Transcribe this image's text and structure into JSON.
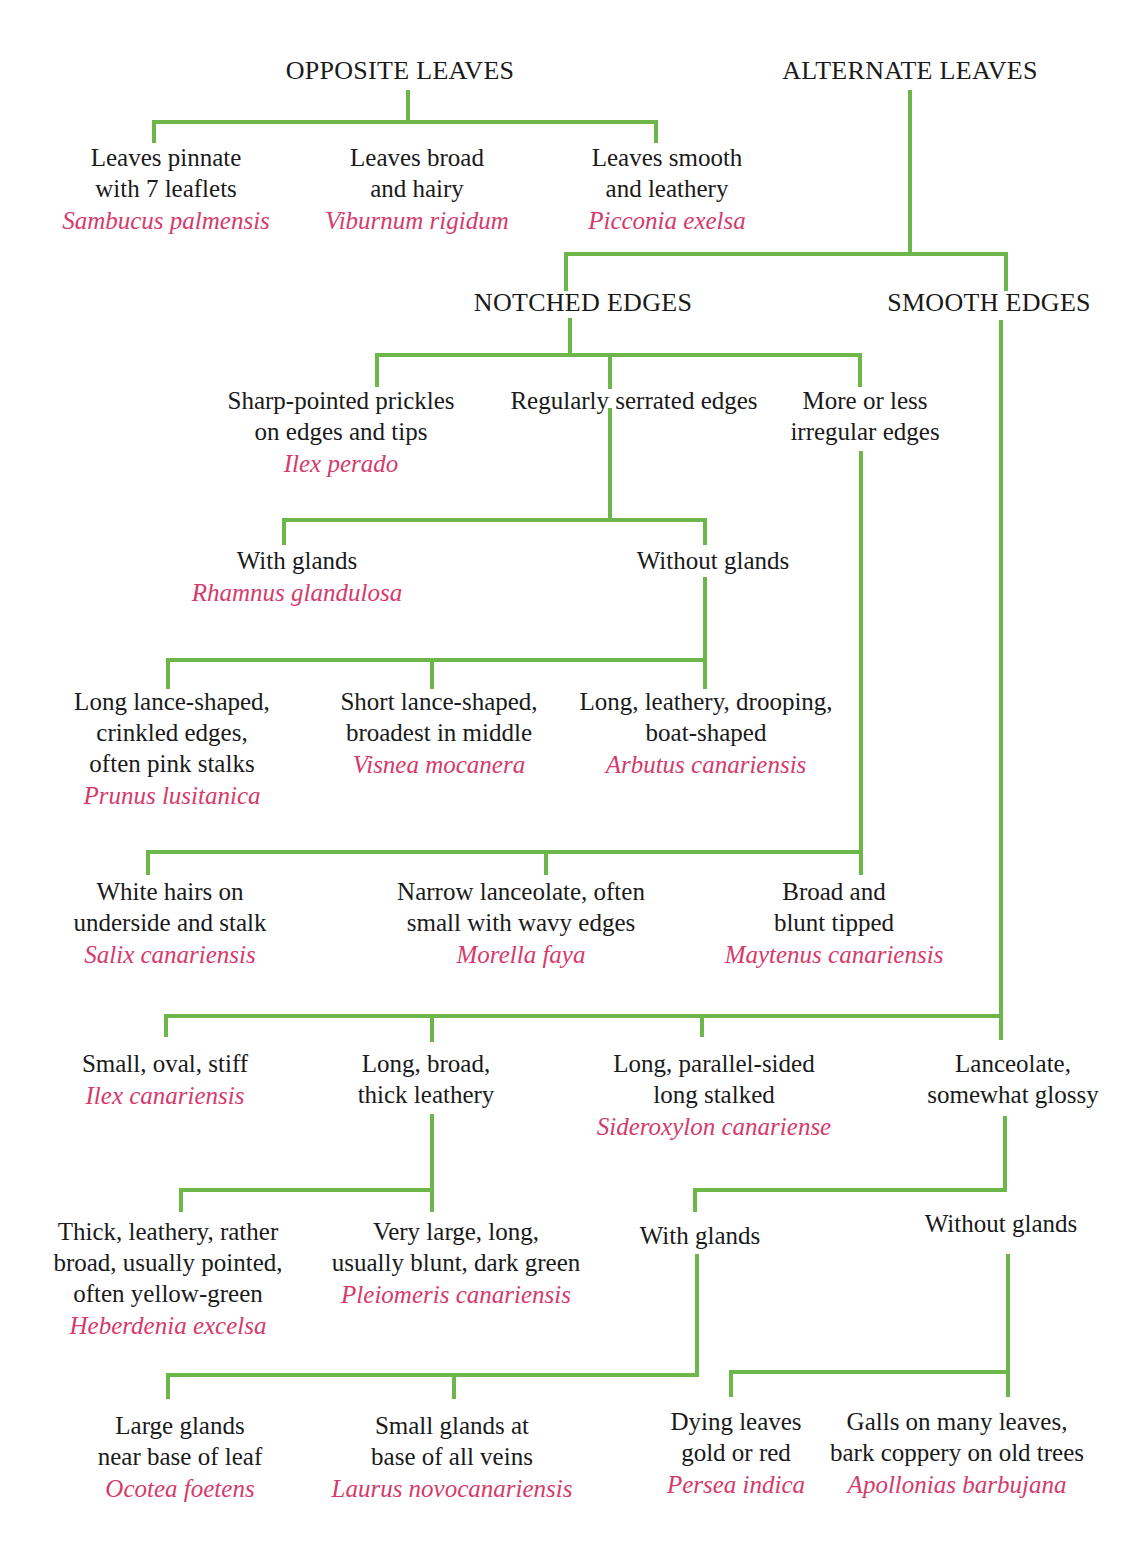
{
  "diagram": {
    "type": "dichotomous-key",
    "colors": {
      "connector": "#6db64a",
      "species": "#d63a6b",
      "text": "#1a1a1a",
      "background": "#ffffff"
    },
    "headings": [
      {
        "id": "opposite",
        "label": "OPPOSITE LEAVES",
        "x": 400,
        "y": 56
      },
      {
        "id": "alternate",
        "label": "ALTERNATE LEAVES",
        "x": 910,
        "y": 56
      },
      {
        "id": "notched",
        "label": "NOTCHED EDGES",
        "x": 583,
        "y": 288
      },
      {
        "id": "smooth",
        "label": "SMOOTH EDGES",
        "x": 989,
        "y": 288
      }
    ],
    "nodes": [
      {
        "id": "n1",
        "parent": "opposite",
        "x": 166,
        "y": 142,
        "lines": [
          "Leaves pinnate",
          "with 7 leaflets"
        ],
        "species": "Sambucus palmensis"
      },
      {
        "id": "n2",
        "parent": "opposite",
        "x": 417,
        "y": 142,
        "lines": [
          "Leaves broad",
          "and hairy"
        ],
        "species": "Viburnum rigidum"
      },
      {
        "id": "n3",
        "parent": "opposite",
        "x": 667,
        "y": 142,
        "lines": [
          "Leaves smooth",
          "and leathery"
        ],
        "species": "Picconia exelsa"
      },
      {
        "id": "n4",
        "parent": "notched",
        "x": 341,
        "y": 385,
        "lines": [
          "Sharp-pointed prickles",
          "on edges and tips"
        ],
        "species": "Ilex perado"
      },
      {
        "id": "n5",
        "parent": "notched",
        "x": 634,
        "y": 385,
        "lines": [
          "Regularly serrated edges"
        ],
        "species": ""
      },
      {
        "id": "n6",
        "parent": "notched",
        "x": 865,
        "y": 385,
        "lines": [
          "More or less",
          "irregular edges"
        ],
        "species": ""
      },
      {
        "id": "n7",
        "parent": "n5",
        "x": 297,
        "y": 545,
        "lines": [
          "With glands"
        ],
        "species": "Rhamnus glandulosa"
      },
      {
        "id": "n8",
        "parent": "n5",
        "x": 713,
        "y": 545,
        "lines": [
          "Without glands"
        ],
        "species": ""
      },
      {
        "id": "n9",
        "parent": "n8",
        "x": 172,
        "y": 686,
        "lines": [
          "Long lance-shaped,",
          "crinkled edges,",
          "often pink stalks"
        ],
        "species": "Prunus lusitanica"
      },
      {
        "id": "n10",
        "parent": "n8",
        "x": 439,
        "y": 686,
        "lines": [
          "Short lance-shaped,",
          "broadest in middle"
        ],
        "species": "Visnea mocanera"
      },
      {
        "id": "n11",
        "parent": "n8",
        "x": 706,
        "y": 686,
        "lines": [
          "Long, leathery, drooping,",
          "boat-shaped"
        ],
        "species": "Arbutus canariensis"
      },
      {
        "id": "n12",
        "parent": "n6",
        "x": 170,
        "y": 876,
        "lines": [
          "White hairs on",
          "underside and stalk"
        ],
        "species": "Salix canariensis"
      },
      {
        "id": "n13",
        "parent": "n6",
        "x": 521,
        "y": 876,
        "lines": [
          "Narrow lanceolate, often",
          "small with wavy edges"
        ],
        "species": "Morella faya"
      },
      {
        "id": "n14",
        "parent": "n6",
        "x": 834,
        "y": 876,
        "lines": [
          "Broad and",
          "blunt tipped"
        ],
        "species": "Maytenus canariensis"
      },
      {
        "id": "n15",
        "parent": "smooth",
        "x": 165,
        "y": 1048,
        "lines": [
          "Small, oval, stiff"
        ],
        "species": "Ilex canariensis"
      },
      {
        "id": "n16",
        "parent": "smooth",
        "x": 426,
        "y": 1048,
        "lines": [
          "Long, broad,",
          "thick leathery"
        ],
        "species": ""
      },
      {
        "id": "n17",
        "parent": "smooth",
        "x": 714,
        "y": 1048,
        "lines": [
          "Long, parallel-sided",
          "long stalked"
        ],
        "species": "Sideroxylon canariense"
      },
      {
        "id": "n18",
        "parent": "smooth",
        "x": 1013,
        "y": 1048,
        "lines": [
          "Lanceolate,",
          "somewhat glossy"
        ],
        "species": ""
      },
      {
        "id": "n19",
        "parent": "n16",
        "x": 168,
        "y": 1216,
        "lines": [
          "Thick, leathery, rather",
          "broad, usually pointed,",
          "often yellow-green"
        ],
        "species": "Heberdenia excelsa"
      },
      {
        "id": "n20",
        "parent": "n16",
        "x": 456,
        "y": 1216,
        "lines": [
          "Very large, long,",
          "usually blunt, dark green"
        ],
        "species": "Pleiomeris canariensis"
      },
      {
        "id": "n21",
        "parent": "n18",
        "x": 700,
        "y": 1220,
        "lines": [
          "With glands"
        ],
        "species": ""
      },
      {
        "id": "n22",
        "parent": "n18",
        "x": 1001,
        "y": 1208,
        "lines": [
          "Without glands"
        ],
        "species": ""
      },
      {
        "id": "n23",
        "parent": "n21",
        "x": 180,
        "y": 1410,
        "lines": [
          "Large glands",
          "near base of leaf"
        ],
        "species": "Ocotea foetens"
      },
      {
        "id": "n24",
        "parent": "n21",
        "x": 452,
        "y": 1410,
        "lines": [
          "Small glands at",
          "base of all veins"
        ],
        "species": "Laurus novocanariensis"
      },
      {
        "id": "n25",
        "parent": "n22",
        "x": 736,
        "y": 1406,
        "lines": [
          "Dying leaves",
          "gold or red"
        ],
        "species": "Persea indica"
      },
      {
        "id": "n26",
        "parent": "n22",
        "x": 957,
        "y": 1406,
        "lines": [
          "Galls on many leaves,",
          "bark coppery on old trees"
        ],
        "species": "Apollonias barbujana"
      }
    ],
    "connectors": [
      [
        408,
        92,
        408,
        122
      ],
      [
        154,
        122,
        656,
        122
      ],
      [
        154,
        122,
        154,
        141
      ],
      [
        656,
        122,
        656,
        141
      ],
      [
        910,
        92,
        910,
        254
      ],
      [
        566,
        254,
        1006,
        254
      ],
      [
        566,
        254,
        566,
        289
      ],
      [
        1006,
        254,
        1006,
        289
      ],
      [
        570,
        320,
        570,
        355
      ],
      [
        377,
        355,
        860,
        355
      ],
      [
        377,
        355,
        377,
        385
      ],
      [
        610,
        355,
        610,
        387
      ],
      [
        860,
        355,
        860,
        385
      ],
      [
        610,
        410,
        610,
        520
      ],
      [
        284,
        520,
        705,
        520
      ],
      [
        284,
        520,
        284,
        543
      ],
      [
        705,
        520,
        705,
        543
      ],
      [
        705,
        579,
        705,
        660
      ],
      [
        168,
        660,
        705,
        660
      ],
      [
        168,
        660,
        168,
        687
      ],
      [
        432,
        660,
        432,
        687
      ],
      [
        705,
        660,
        705,
        687
      ],
      [
        861,
        453,
        861,
        873
      ],
      [
        148,
        852,
        861,
        852
      ],
      [
        148,
        852,
        148,
        873
      ],
      [
        546,
        852,
        546,
        873
      ],
      [
        1001,
        322,
        1001,
        1038
      ],
      [
        166,
        1016,
        1001,
        1016
      ],
      [
        166,
        1016,
        166,
        1035
      ],
      [
        432,
        1016,
        432,
        1040
      ],
      [
        702,
        1016,
        702,
        1035
      ],
      [
        432,
        1116,
        432,
        1190
      ],
      [
        181,
        1190,
        432,
        1190
      ],
      [
        181,
        1190,
        181,
        1210
      ],
      [
        432,
        1190,
        432,
        1210
      ],
      [
        1005,
        1118,
        1005,
        1190
      ],
      [
        695,
        1190,
        1005,
        1190
      ],
      [
        695,
        1190,
        695,
        1210
      ],
      [
        697,
        1256,
        697,
        1375
      ],
      [
        168,
        1375,
        697,
        1375
      ],
      [
        168,
        1375,
        168,
        1397
      ],
      [
        454,
        1375,
        454,
        1397
      ],
      [
        1008,
        1256,
        1008,
        1372
      ],
      [
        731,
        1372,
        1008,
        1372
      ],
      [
        731,
        1372,
        731,
        1395
      ],
      [
        1008,
        1372,
        1008,
        1395
      ]
    ]
  }
}
